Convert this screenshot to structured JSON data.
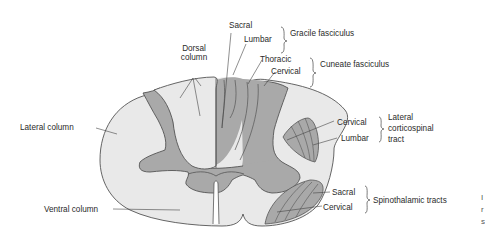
{
  "colors": {
    "white_matter": "#e9e9e9",
    "gray_matter": "#a9a9a9",
    "tract_fill": "#a9a9a9",
    "outline": "#555555",
    "text": "#2a2a2a"
  },
  "labels": {
    "dorsal_column": [
      "Dorsal",
      "column"
    ],
    "lateral_column": "Lateral column",
    "ventral_column": "Ventral column",
    "gracile": {
      "sacral": "Sacral",
      "lumbar": "Lumbar",
      "group": "Gracile fasciculus"
    },
    "cuneate": {
      "thoracic": "Thoracic",
      "cervical": "Cervical",
      "group": "Cuneate fasciculus"
    },
    "lateral_corticospinal": {
      "cervical": "Cervical",
      "lumbar": "Lumbar",
      "group": [
        "Lateral",
        "corticospinal",
        "tract"
      ]
    },
    "spinothalamic": {
      "sacral": "Sacral",
      "cervical": "Cervical",
      "group": "Spinothalamic tracts"
    }
  },
  "edge_fragments": [
    "I",
    "r",
    "s"
  ]
}
